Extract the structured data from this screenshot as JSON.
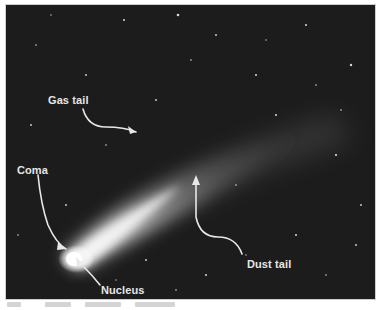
{
  "figure": {
    "background_color": "#1c1c1c",
    "label_color": "#e6e6e6",
    "labels": {
      "gas_tail": "Gas tail",
      "coma": "Coma",
      "nucleus": "Nucleus",
      "dust_tail": "Dust tail"
    }
  }
}
